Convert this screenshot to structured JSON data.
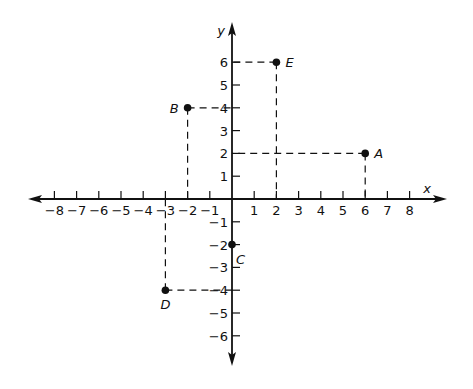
{
  "chart_data": {
    "type": "scatter",
    "title": "",
    "xlabel": "x",
    "ylabel": "y",
    "xlim": [
      -8.5,
      9.5
    ],
    "ylim": [
      -6.8,
      7.2
    ],
    "grid": false,
    "x_ticks": [
      -8,
      -7,
      -6,
      -5,
      -4,
      -3,
      -2,
      -1,
      1,
      2,
      3,
      4,
      5,
      6,
      7,
      8
    ],
    "x_tick_labels": [
      "−8",
      "−7",
      "−6",
      "−5",
      "−4",
      "−3",
      "−2",
      "−1",
      "1",
      "2",
      "3",
      "4",
      "5",
      "6",
      "7",
      "8"
    ],
    "y_ticks": [
      -6,
      -5,
      -4,
      -3,
      -2,
      -1,
      1,
      2,
      3,
      4,
      5,
      6
    ],
    "y_tick_labels": [
      "−6",
      "−5",
      "−4",
      "−3",
      "−2",
      "−1",
      "1",
      "2",
      "3",
      "4",
      "5",
      "6"
    ],
    "points": [
      {
        "label": "A",
        "x": 6,
        "y": 2,
        "label_position": "right"
      },
      {
        "label": "B",
        "x": -2,
        "y": 4,
        "label_position": "left"
      },
      {
        "label": "C",
        "x": 0,
        "y": -2,
        "label_position": "below-right"
      },
      {
        "label": "D",
        "x": -3,
        "y": -4,
        "label_position": "below"
      },
      {
        "label": "E",
        "x": 2,
        "y": 6,
        "label_position": "right"
      }
    ],
    "projection_lines": "dashed lines from each point to both axes",
    "colors": {
      "ink": "#111111",
      "background": "#ffffff"
    }
  }
}
